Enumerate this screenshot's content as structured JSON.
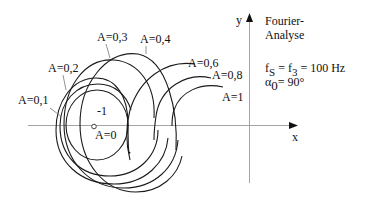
{
  "diagram": {
    "title_line1": "Fourier-",
    "title_line2": "Analyse",
    "param_fs": "f",
    "param_fs_sub": "S",
    "param_eq1": " = f",
    "param_f3_sub": "3",
    "param_eq2": " = 100 Hz",
    "param_alpha": "α",
    "param_alpha_sub": "0",
    "param_alpha_val": "= 90°",
    "axis_x_label": "x",
    "axis_y_label": "y",
    "critical_point_label": "-1",
    "curves": [
      {
        "label": "A=0"
      },
      {
        "label": "A=0,1"
      },
      {
        "label": "A=0,2"
      },
      {
        "label": "A=0,3"
      },
      {
        "label": "A=0,4"
      },
      {
        "label": "A=0,6"
      },
      {
        "label": "A=0,8"
      },
      {
        "label": "A=1"
      }
    ]
  }
}
